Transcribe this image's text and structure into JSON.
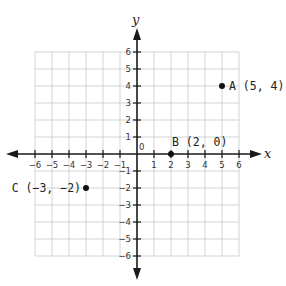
{
  "diagram": {
    "type": "coordinate_plane",
    "x_axis_label": "x",
    "y_axis_label": "y",
    "origin_label": "0",
    "x_range": [
      -6,
      6
    ],
    "y_range": [
      -6,
      6
    ],
    "x_ticks": [
      "-6",
      "-5",
      "-4",
      "-3",
      "-2",
      "-1",
      "1",
      "2",
      "3",
      "4",
      "5",
      "6"
    ],
    "y_ticks": [
      "6",
      "5",
      "4",
      "3",
      "2",
      "1",
      "-1",
      "-2",
      "-3",
      "-4",
      "-5",
      "-6"
    ],
    "colors": {
      "grid": "#c8c8c8",
      "axis": "#1a1a1a",
      "point": "#111111",
      "text": "#222222"
    },
    "points": [
      {
        "name": "A",
        "x": 5,
        "y": 4,
        "label": "A (5, 4)"
      },
      {
        "name": "B",
        "x": 2,
        "y": 0,
        "label": "B (2, 0)"
      },
      {
        "name": "C",
        "x": -3,
        "y": -2,
        "label": "C (−3, −2)"
      }
    ]
  }
}
